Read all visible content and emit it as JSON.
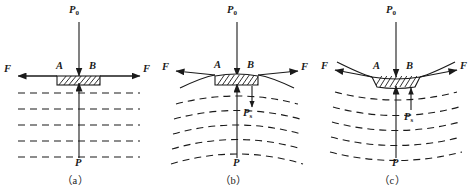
{
  "figure": {
    "panels": [
      {
        "id": "a",
        "caption": "（a）",
        "surface_type": "flat",
        "labels": {
          "top_pressure": "P",
          "top_pressure_sub": "0",
          "left_force": "F",
          "right_force": "F",
          "point_left": "A",
          "point_right": "B",
          "bottom_pressure": "P",
          "surface_pressure": null,
          "surface_pressure_sub": null
        }
      },
      {
        "id": "b",
        "caption": "（b）",
        "surface_type": "convex",
        "labels": {
          "top_pressure": "P",
          "top_pressure_sub": "0",
          "left_force": "F",
          "right_force": "F",
          "point_left": "A",
          "point_right": "B",
          "bottom_pressure": "P",
          "surface_pressure": "P",
          "surface_pressure_sub": "s"
        }
      },
      {
        "id": "c",
        "caption": "（c）",
        "surface_type": "concave",
        "labels": {
          "top_pressure": "P",
          "top_pressure_sub": "0",
          "left_force": "F",
          "right_force": "F",
          "point_left": "A",
          "point_right": "B",
          "bottom_pressure": "P",
          "surface_pressure": "P",
          "surface_pressure_sub": "s"
        }
      }
    ],
    "colors": {
      "ink": "#1a1a1a",
      "background": "#ffffff"
    }
  }
}
